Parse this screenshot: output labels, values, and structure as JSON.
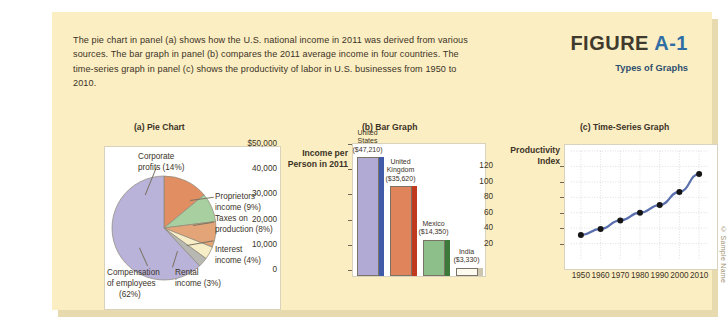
{
  "figure": {
    "intro_text": "The pie chart in panel (a) shows how the U.S. national income in 2011 was derived from various sources. The bar graph in panel (b) compares the 2011 average income in four countries. The time-series graph in panel (c) shows the productivity of labor in U.S. businesses from 1950 to 2010.",
    "label_word": "FIGURE",
    "label_number": "A-1",
    "subtitle": "Types of Graphs",
    "copyright": "© Sample Name"
  },
  "panels": {
    "a_caption": "(a) Pie Chart",
    "b_caption": "(b) Bar Graph",
    "c_caption": "(c) Time-Series Graph"
  },
  "chart_data": [
    {
      "type": "pie",
      "title": "(a) Pie Chart",
      "subject": "U.S. national income by source, 2011",
      "categories": [
        "Compensation of employees (62%)",
        "Corporate profits (14%)",
        "Proprietors' income (9%)",
        "Taxes on production (8%)",
        "Interest income (4%)",
        "Rental income (3%)"
      ],
      "values": [
        62,
        14,
        9,
        8,
        4,
        3
      ],
      "labels": [
        "Compensation of employees (62%)",
        "Corporate profits (14%)",
        "Proprietors' income (9%)",
        "Taxes on production (8%)",
        "Interest income (4%)",
        "Rental income (3%)"
      ],
      "label_lines": {
        "corporate": [
          "Corporate",
          "profits (14%)"
        ],
        "proprietors": [
          "Proprietors'",
          "income (9%)"
        ],
        "taxes": [
          "Taxes on",
          "production (8%)"
        ],
        "interest": [
          "Interest",
          "income (4%)"
        ],
        "rental": [
          "Rental",
          "income (3%)"
        ],
        "compensation": [
          "Compensation",
          "of employees",
          "(62%)"
        ]
      },
      "colors": [
        "#b9b3da",
        "#e08e62",
        "#a8cfa0",
        "#e3a578",
        "#f7eec8",
        "#b8b8b3"
      ],
      "legend": "labels-outside"
    },
    {
      "type": "bar",
      "title": "(b) Bar Graph",
      "ylabel": "Income per Person in 2011",
      "ylabel_lines": [
        "Income per",
        "Person in 2011"
      ],
      "categories": [
        "United States",
        "United Kingdom",
        "Mexico",
        "India"
      ],
      "category_lines": [
        [
          "United",
          "States",
          "($47,210)"
        ],
        [
          "United",
          "Kingdom",
          "($35,620)"
        ],
        [
          "Mexico",
          "($14,350)"
        ],
        [
          "India",
          "($3,330)"
        ]
      ],
      "values": [
        47210,
        35620,
        14350,
        3330
      ],
      "value_labels": [
        "($47,210)",
        "($35,620)",
        "($14,350)",
        "($3,330)"
      ],
      "ylim": [
        0,
        50000
      ],
      "yticks": [
        0,
        10000,
        20000,
        30000,
        40000,
        50000
      ],
      "ytick_labels": [
        "0",
        "10,000",
        "20,000",
        "30,000",
        "40,000",
        "$50,000"
      ],
      "colors": [
        "#b0aad4",
        "#e0845c",
        "#8cbf8a",
        "#fdfaf0"
      ],
      "side_colors": [
        "#3f5aa8",
        "#c03a1f",
        "#3c7a3a",
        "#cdc6ae"
      ],
      "grid": false
    },
    {
      "type": "line",
      "title": "(c) Time-Series Graph",
      "ylabel": "Productivity Index",
      "ylabel_lines": [
        "Productivity",
        "Index"
      ],
      "xlabel": "",
      "x": [
        1950,
        1960,
        1970,
        1980,
        1990,
        2000,
        2010
      ],
      "xtick_labels": [
        "1950",
        "1960",
        "1970",
        "1980",
        "1990",
        "2000",
        "2010"
      ],
      "values": [
        31,
        39,
        50,
        60,
        70,
        87,
        110
      ],
      "series": [
        {
          "name": "Productivity Index",
          "values": [
            31,
            39,
            50,
            60,
            70,
            87,
            110
          ]
        }
      ],
      "ylim": [
        0,
        140
      ],
      "yticks": [
        20,
        40,
        60,
        80,
        100,
        120
      ],
      "ytick_labels": [
        "20",
        "40",
        "60",
        "80",
        "100",
        "120"
      ],
      "xlim": [
        1945,
        2015
      ],
      "grid": true,
      "line_color": "#5a6fae",
      "marker_color": "#151515"
    }
  ]
}
